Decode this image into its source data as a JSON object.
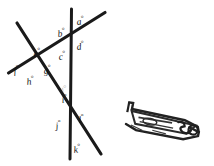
{
  "figure": {
    "background_color": "#ffffff",
    "line_color": "#1a1a1a",
    "label_color": "#111111",
    "lines": [
      {
        "name": "vertical-line",
        "x1": 71.5,
        "y1": 9,
        "x2": 70.0,
        "y2": 159,
        "width": 3.0
      },
      {
        "name": "rising-diagonal-line",
        "x1": 8.5,
        "y1": 73,
        "x2": 105.0,
        "y2": 12.5,
        "width": 3.2
      },
      {
        "name": "falling-diagonal-line",
        "x1": 17.0,
        "y1": 23,
        "x2": 101.0,
        "y2": 154.0,
        "width": 3.2
      }
    ],
    "intersections": [
      {
        "name": "top-intersection",
        "x": 71.0,
        "y": 28.0
      },
      {
        "name": "left-intersection",
        "x": 34.0,
        "y": 66.0
      },
      {
        "name": "bottom-intersection",
        "x": 70.5,
        "y": 123.0
      }
    ],
    "labels": [
      {
        "id": "a",
        "text": "a",
        "degree": "°",
        "x": 76,
        "y": 16
      },
      {
        "id": "b",
        "text": "b",
        "degree": "°",
        "x": 57,
        "y": 28
      },
      {
        "id": "c",
        "text": "c",
        "degree": "°",
        "x": 58,
        "y": 51
      },
      {
        "id": "d",
        "text": "d",
        "degree": "°",
        "x": 76,
        "y": 41
      },
      {
        "id": "e",
        "text": "e",
        "degree": "°",
        "x": 33,
        "y": 48
      },
      {
        "id": "f",
        "text": "f",
        "degree": "°",
        "x": 13,
        "y": 65
      },
      {
        "id": "g",
        "text": "g",
        "degree": "°",
        "x": 43,
        "y": 65
      },
      {
        "id": "h",
        "text": "h",
        "degree": "°",
        "x": 26,
        "y": 76
      },
      {
        "id": "i",
        "text": "i",
        "degree": "°",
        "x": 61,
        "y": 94
      },
      {
        "id": "j",
        "text": "j",
        "degree": "°",
        "x": 55,
        "y": 120
      },
      {
        "id": "k",
        "text": "k",
        "degree": "°",
        "x": 73,
        "y": 144
      },
      {
        "id": "l",
        "text": "l",
        "degree": "°",
        "x": 78,
        "y": 114
      }
    ],
    "smudge_mark": {
      "name": "faint-ink-smudge",
      "text": "ı°",
      "x": 60,
      "y": 85
    },
    "ink_sketch": {
      "name": "ink-sketch-blob",
      "description": "small tilted elongated ink sketch",
      "x": 128,
      "y": 98,
      "width": 80,
      "height": 40,
      "color": "#1f1f1f"
    }
  }
}
